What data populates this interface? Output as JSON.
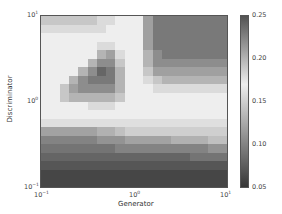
{
  "chart_data": {
    "type": "heatmap",
    "title": "",
    "xlabel": "Generator",
    "ylabel": "Discriminator",
    "xscale": "log",
    "yscale": "log",
    "xlim": [
      0.1,
      10
    ],
    "ylim": [
      0.1,
      10
    ],
    "x_ticks": [
      "10^-1",
      "10^0",
      "10^1"
    ],
    "y_ticks": [
      "10^-1",
      "10^0",
      "10^1"
    ],
    "colorbar": {
      "range": [
        0.05,
        0.25
      ],
      "ticks": [
        "0.05",
        "0.10",
        "0.15",
        "0.20",
        "0.25"
      ],
      "colormap": "diverging grey: dark at 0.05 and 0.25, light near 0.17"
    },
    "grid_rows_top_to_bottom": 20,
    "grid_cols_left_to_right": 20,
    "values": [
      [
        0.19,
        0.19,
        0.19,
        0.19,
        0.19,
        0.19,
        0.18,
        0.18,
        0.17,
        0.17,
        0.17,
        0.21,
        0.23,
        0.23,
        0.23,
        0.23,
        0.23,
        0.23,
        0.23,
        0.23
      ],
      [
        0.18,
        0.18,
        0.18,
        0.18,
        0.18,
        0.18,
        0.18,
        0.17,
        0.17,
        0.17,
        0.17,
        0.21,
        0.23,
        0.23,
        0.23,
        0.23,
        0.23,
        0.23,
        0.23,
        0.23
      ],
      [
        0.17,
        0.17,
        0.17,
        0.17,
        0.17,
        0.17,
        0.17,
        0.17,
        0.17,
        0.17,
        0.17,
        0.21,
        0.23,
        0.23,
        0.23,
        0.23,
        0.23,
        0.23,
        0.23,
        0.23
      ],
      [
        0.17,
        0.17,
        0.17,
        0.17,
        0.17,
        0.17,
        0.18,
        0.18,
        0.17,
        0.17,
        0.17,
        0.21,
        0.23,
        0.23,
        0.23,
        0.23,
        0.23,
        0.23,
        0.23,
        0.23
      ],
      [
        0.17,
        0.17,
        0.17,
        0.17,
        0.17,
        0.17,
        0.2,
        0.21,
        0.18,
        0.17,
        0.17,
        0.2,
        0.22,
        0.23,
        0.23,
        0.23,
        0.23,
        0.23,
        0.23,
        0.23
      ],
      [
        0.17,
        0.17,
        0.17,
        0.17,
        0.17,
        0.2,
        0.22,
        0.22,
        0.19,
        0.17,
        0.17,
        0.2,
        0.22,
        0.22,
        0.22,
        0.22,
        0.22,
        0.22,
        0.22,
        0.22
      ],
      [
        0.17,
        0.17,
        0.17,
        0.17,
        0.2,
        0.22,
        0.24,
        0.23,
        0.2,
        0.17,
        0.17,
        0.19,
        0.21,
        0.21,
        0.21,
        0.21,
        0.21,
        0.21,
        0.21,
        0.21
      ],
      [
        0.17,
        0.17,
        0.17,
        0.2,
        0.22,
        0.23,
        0.23,
        0.23,
        0.2,
        0.17,
        0.17,
        0.18,
        0.19,
        0.2,
        0.2,
        0.2,
        0.2,
        0.2,
        0.2,
        0.2
      ],
      [
        0.17,
        0.17,
        0.19,
        0.21,
        0.22,
        0.22,
        0.22,
        0.22,
        0.2,
        0.17,
        0.17,
        0.17,
        0.18,
        0.18,
        0.18,
        0.18,
        0.18,
        0.18,
        0.18,
        0.18
      ],
      [
        0.17,
        0.17,
        0.19,
        0.2,
        0.2,
        0.2,
        0.2,
        0.2,
        0.19,
        0.17,
        0.17,
        0.17,
        0.17,
        0.17,
        0.17,
        0.17,
        0.17,
        0.17,
        0.17,
        0.17
      ],
      [
        0.17,
        0.17,
        0.17,
        0.17,
        0.17,
        0.18,
        0.18,
        0.18,
        0.17,
        0.17,
        0.17,
        0.17,
        0.17,
        0.17,
        0.17,
        0.17,
        0.17,
        0.17,
        0.17,
        0.17
      ],
      [
        0.17,
        0.17,
        0.17,
        0.17,
        0.17,
        0.17,
        0.17,
        0.17,
        0.17,
        0.17,
        0.17,
        0.17,
        0.17,
        0.17,
        0.17,
        0.17,
        0.17,
        0.17,
        0.17,
        0.17
      ],
      [
        0.16,
        0.16,
        0.16,
        0.16,
        0.16,
        0.16,
        0.16,
        0.16,
        0.16,
        0.16,
        0.16,
        0.16,
        0.16,
        0.16,
        0.16,
        0.16,
        0.16,
        0.16,
        0.16,
        0.16
      ],
      [
        0.12,
        0.12,
        0.12,
        0.12,
        0.12,
        0.12,
        0.13,
        0.13,
        0.14,
        0.15,
        0.15,
        0.15,
        0.15,
        0.15,
        0.15,
        0.15,
        0.15,
        0.15,
        0.15,
        0.15
      ],
      [
        0.1,
        0.1,
        0.1,
        0.1,
        0.1,
        0.1,
        0.11,
        0.11,
        0.11,
        0.12,
        0.12,
        0.12,
        0.12,
        0.12,
        0.13,
        0.13,
        0.13,
        0.13,
        0.14,
        0.14
      ],
      [
        0.09,
        0.09,
        0.09,
        0.09,
        0.09,
        0.09,
        0.09,
        0.09,
        0.1,
        0.1,
        0.1,
        0.1,
        0.1,
        0.1,
        0.1,
        0.1,
        0.1,
        0.1,
        0.11,
        0.11
      ],
      [
        0.08,
        0.08,
        0.08,
        0.08,
        0.08,
        0.08,
        0.08,
        0.08,
        0.08,
        0.08,
        0.08,
        0.08,
        0.08,
        0.08,
        0.08,
        0.08,
        0.09,
        0.09,
        0.09,
        0.09
      ],
      [
        0.07,
        0.07,
        0.07,
        0.07,
        0.07,
        0.07,
        0.07,
        0.07,
        0.07,
        0.07,
        0.07,
        0.07,
        0.07,
        0.07,
        0.07,
        0.07,
        0.07,
        0.07,
        0.07,
        0.07
      ],
      [
        0.06,
        0.06,
        0.06,
        0.06,
        0.06,
        0.06,
        0.06,
        0.06,
        0.06,
        0.06,
        0.06,
        0.06,
        0.06,
        0.06,
        0.06,
        0.06,
        0.06,
        0.06,
        0.06,
        0.06
      ],
      [
        0.06,
        0.06,
        0.06,
        0.06,
        0.06,
        0.06,
        0.06,
        0.06,
        0.06,
        0.06,
        0.06,
        0.06,
        0.06,
        0.06,
        0.06,
        0.06,
        0.06,
        0.06,
        0.06,
        0.06
      ]
    ]
  },
  "axes": {
    "xlabel": "Generator",
    "ylabel": "Discriminator",
    "x_tick_labels": [
      {
        "base": "10",
        "exp": "−1"
      },
      {
        "base": "10",
        "exp": "0"
      },
      {
        "base": "10",
        "exp": "1"
      }
    ],
    "y_tick_labels": [
      {
        "base": "10",
        "exp": "1"
      },
      {
        "base": "10",
        "exp": "0"
      },
      {
        "base": "10",
        "exp": "−1"
      }
    ],
    "colorbar_tick_labels": [
      "0.25",
      "0.20",
      "0.15",
      "0.10",
      "0.05"
    ]
  }
}
